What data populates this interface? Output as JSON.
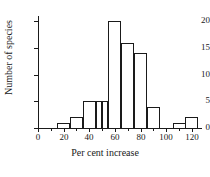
{
  "chart_data": {
    "type": "bar",
    "title": "",
    "subtitle": "",
    "xlabel": "Per cent increase",
    "ylabel": "Number of species",
    "xlim": [
      0,
      128
    ],
    "ylim": [
      0,
      21
    ],
    "grid": false,
    "legend": null,
    "x_ticks": [
      0,
      20,
      40,
      60,
      80,
      100,
      120
    ],
    "x_tick_labels": [
      "0",
      "20",
      "40",
      "60",
      "80",
      "100",
      "120"
    ],
    "x_minor_ticks": [
      10,
      30,
      50,
      70,
      90,
      110
    ],
    "y_ticks": [
      0,
      5,
      10,
      15,
      20
    ],
    "y_tick_labels": [
      "0",
      "5",
      "10",
      "15",
      "20"
    ],
    "bin_width": 10,
    "bins": [
      {
        "start": 15,
        "end": 25,
        "value": 1
      },
      {
        "start": 25,
        "end": 35,
        "value": 2
      },
      {
        "start": 35,
        "end": 45,
        "value": 5
      },
      {
        "start": 45,
        "end": 50,
        "value": 5
      },
      {
        "start": 50,
        "end": 55,
        "value": 5
      },
      {
        "start": 55,
        "end": 65,
        "value": 20
      },
      {
        "start": 65,
        "end": 75,
        "value": 16
      },
      {
        "start": 75,
        "end": 85,
        "value": 14
      },
      {
        "start": 85,
        "end": 95,
        "value": 4
      },
      {
        "start": 105,
        "end": 115,
        "value": 1
      },
      {
        "start": 115,
        "end": 125,
        "value": 2
      }
    ],
    "categories": [
      "15-25",
      "25-35",
      "35-45",
      "45-50",
      "50-55",
      "55-65",
      "65-75",
      "75-85",
      "85-95",
      "105-115",
      "115-125"
    ],
    "values": [
      1,
      2,
      5,
      5,
      5,
      20,
      16,
      14,
      4,
      1,
      2
    ],
    "colors": {
      "bar_fill": "#ffffff",
      "bar_edge": "#1a1a1a",
      "axis": "#1a1a1a",
      "text": "#1a1a1a",
      "background": "#ffffff"
    }
  }
}
